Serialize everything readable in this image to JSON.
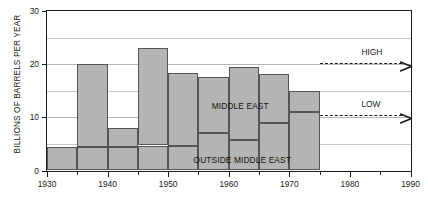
{
  "chart_data": {
    "type": "bar",
    "title": "",
    "subtitle": "",
    "xlabel": "",
    "ylabel": "BILLIONS OF BARRELS PER YEAR",
    "xlim": [
      1930,
      1990
    ],
    "ylim": [
      0,
      30
    ],
    "grid": true,
    "stacked": true,
    "bar_width_years": 5,
    "legend_position": "in-plot",
    "y_ticks_major": [
      0,
      10,
      20,
      30
    ],
    "y_ticks_major_labels": [
      "0",
      "10",
      "20",
      "30"
    ],
    "y_gridlines": [
      5,
      10,
      15,
      20,
      25
    ],
    "x_ticks_major": [
      1930,
      1940,
      1950,
      1960,
      1970,
      1980,
      1990
    ],
    "x_ticks_major_labels": [
      "1930",
      "1940",
      "1950",
      "1960",
      "1970",
      "1980",
      "1990"
    ],
    "x_ticks_minor": [
      1935,
      1945,
      1955,
      1965,
      1975,
      1985
    ],
    "categories": [
      "1930-1935",
      "1935-1940",
      "1940-1945",
      "1945-1950",
      "1950-1955",
      "1955-1960",
      "1960-1965",
      "1965-1970",
      "1970-1975"
    ],
    "bin_starts": [
      1930,
      1935,
      1940,
      1945,
      1950,
      1955,
      1960,
      1965,
      1970
    ],
    "bin_ends": [
      1935,
      1940,
      1945,
      1950,
      1955,
      1960,
      1965,
      1970,
      1975
    ],
    "series": [
      {
        "name": "OUTSIDE MIDDLE EAST",
        "values": [
          4.5,
          4.5,
          4.5,
          4.7,
          4.7,
          7.0,
          5.8,
          9.0,
          11.0
        ]
      },
      {
        "name": "MIDDLE EAST",
        "values": [
          0.0,
          15.5,
          3.5,
          18.3,
          13.6,
          10.6,
          13.7,
          9.2,
          4.0
        ]
      }
    ],
    "totals": [
      4.5,
      20.0,
      8.0,
      23.0,
      18.3,
      17.6,
      19.5,
      18.2,
      15.0
    ],
    "annotations": [
      {
        "text": "HIGH",
        "y_value": 20.3,
        "x_start": 1975,
        "x_end": 1990,
        "style": "dashed-arrow"
      },
      {
        "text": "LOW",
        "y_value": 10.5,
        "x_start": 1975,
        "x_end": 1990,
        "style": "dashed-arrow"
      }
    ],
    "colors": {
      "bar_fill": "#b4b4b4",
      "bar_edge": "#555555",
      "axis": "#1a1a1a",
      "grid": "#c9c9c9",
      "background": "#ffffff"
    }
  },
  "series_labels": {
    "middle_east": "MIDDLE EAST",
    "outside_middle_east": "OUTSIDE MIDDLE EAST"
  },
  "axis": {
    "y_title": "BILLIONS OF BARRELS PER YEAR"
  }
}
